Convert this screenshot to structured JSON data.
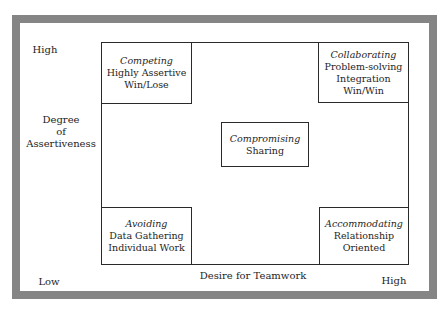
{
  "diagram": {
    "y_axis": {
      "high_label": "High",
      "title_lines": [
        "Degree",
        "of",
        "Assertiveness"
      ]
    },
    "x_axis": {
      "low_label": "Low",
      "title": "Desire for Teamwork",
      "high_label": "High"
    },
    "styles": [
      {
        "name": "Competing",
        "lines": [
          "Highly Assertive",
          "Win/Lose"
        ],
        "position": "top-left"
      },
      {
        "name": "Collaborating",
        "lines": [
          "Problem-solving",
          "Integration",
          "Win/Win"
        ],
        "position": "top-right"
      },
      {
        "name": "Compromising",
        "lines": [
          "Sharing"
        ],
        "position": "center"
      },
      {
        "name": "Avoiding",
        "lines": [
          "Data Gathering",
          "Individual Work"
        ],
        "position": "bottom-left"
      },
      {
        "name": "Accommodating",
        "lines": [
          "Relationship",
          "Oriented"
        ],
        "position": "bottom-right"
      }
    ],
    "colors": {
      "frame": "#858585",
      "lines": "#2a2a2a",
      "background": "#ffffff"
    }
  }
}
